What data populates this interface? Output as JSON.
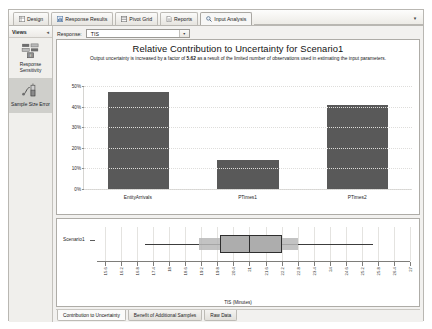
{
  "ribbon": {
    "tabs": [
      {
        "label": "Design",
        "icon": "grid-icon",
        "active": false
      },
      {
        "label": "Response Results",
        "icon": "chart-icon",
        "active": false
      },
      {
        "label": "Pivot Grid",
        "icon": "table-icon",
        "active": false
      },
      {
        "label": "Reports",
        "icon": "report-icon",
        "active": false
      },
      {
        "label": "Input Analysis",
        "icon": "magnifier-icon",
        "active": true
      }
    ],
    "overflow_glyph": "▾"
  },
  "views": {
    "title": "Views",
    "collapse_glyph": "◂",
    "items": [
      {
        "label": "Response Sensitivity",
        "icon": "sensitivity-icon",
        "selected": false
      },
      {
        "label": "Sample Size Error",
        "icon": "sample-size-icon",
        "selected": true
      }
    ]
  },
  "toolbar": {
    "response_label": "Response:",
    "response_value": "TIS",
    "dropdown_glyph": "▾"
  },
  "chart_data": [
    {
      "type": "bar",
      "title": "Relative Contribution to Uncertainty for Scenario1",
      "subtitle_pre": "Output uncertainty is increased by a factor of ",
      "subtitle_factor": "5.62",
      "subtitle_post": " as a result of the limited number of observations used in estimating the input parameters.",
      "categories": [
        "EntityArrivals",
        "PTimes1",
        "PTimes2"
      ],
      "values": [
        47,
        14,
        41
      ],
      "ylabel": "",
      "xlabel": "",
      "ylim": [
        0,
        50
      ],
      "yticks": [
        0,
        10,
        20,
        30,
        40,
        50
      ],
      "ytick_labels": [
        "0%",
        "10%",
        "20%",
        "30%",
        "40%",
        "50%"
      ],
      "grid": true,
      "legend": "none",
      "bar_color": "#595959"
    },
    {
      "type": "boxplot",
      "title": "",
      "xlabel": "TIS (Minutes)",
      "row_label": "Scenario1",
      "xlim": [
        15.3,
        27.0
      ],
      "xticks": [
        15.6,
        16.2,
        16.8,
        17.4,
        18,
        18.6,
        19.2,
        19.8,
        20.4,
        21,
        21.6,
        22.2,
        22.8,
        23.4,
        24,
        24.6,
        25.2,
        25.8,
        26.4,
        27
      ],
      "xtick_labels": [
        "15.6",
        "16.2",
        "16.8",
        "17.4",
        "18",
        "18.6",
        "19.2",
        "19.8",
        "20.4",
        "21",
        "21.6",
        "22.2",
        "22.8",
        "23.4",
        "24",
        "24.6",
        "25.2",
        "25.8",
        "26.4",
        "27"
      ],
      "whisker_low": 17.1,
      "whisker_high": 25.6,
      "ci_low": 19.1,
      "ci_high": 22.8,
      "box_low": 19.9,
      "box_high": 22.2,
      "median": 21.0,
      "box_color": "#adadad",
      "band_color": "#b9b9b9"
    }
  ],
  "bottom_tabs": [
    {
      "label": "Contribution to Uncertainty",
      "active": true
    },
    {
      "label": "Benefit of Additional Samples",
      "active": false
    },
    {
      "label": "Raw Data",
      "active": false
    }
  ]
}
